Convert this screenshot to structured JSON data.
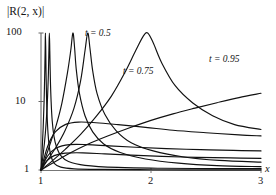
{
  "figure": {
    "ylabel": "|R(2, x)|",
    "xlabel": "x",
    "y_ticks": [
      "100",
      "10",
      "1"
    ],
    "x_ticks": [
      "1",
      "2",
      "3"
    ],
    "curve_labels": [
      "t = 0.5",
      "t = 0.75",
      "t = 0.95"
    ]
  },
  "chart_data": {
    "type": "line",
    "title": "",
    "xlabel": "x",
    "ylabel": "|R(2, x)|",
    "xlim": [
      1,
      3
    ],
    "ylim": [
      1,
      100
    ],
    "yscale": "log",
    "xscale": "linear",
    "grid": false,
    "legend": "inline-annotations",
    "xticks": [
      1,
      2,
      3
    ],
    "yticks": [
      1,
      10,
      100
    ],
    "annotations": [
      {
        "text": "t = 0.5",
        "x": 1.42,
        "y": 62
      },
      {
        "text": "t = 0.75",
        "x": 1.72,
        "y": 23
      },
      {
        "text": "t = 0.95",
        "x": 2.46,
        "y": 30
      }
    ],
    "series": [
      {
        "name": "t = 0.5 (pole a)",
        "comment": "steep vertical asymptote just right of x=1",
        "x": [
          1.0,
          1.01,
          1.02,
          1.028,
          1.034,
          1.038,
          1.04,
          1.043,
          1.046,
          1.05,
          1.056,
          1.064,
          1.075,
          1.09,
          1.12,
          1.18,
          1.3,
          1.55,
          2.0,
          2.5,
          3.0
        ],
        "y": [
          1.0,
          1.9,
          4.2,
          10.0,
          26.0,
          60.0,
          100.0,
          60.0,
          26.0,
          12.0,
          6.0,
          3.4,
          2.2,
          1.6,
          1.25,
          1.1,
          1.04,
          1.02,
          1.01,
          1.005,
          1.003
        ]
      },
      {
        "name": "t = 0.5 (pole b)",
        "comment": "second narrow spike",
        "x": [
          1.0,
          1.02,
          1.04,
          1.055,
          1.066,
          1.072,
          1.076,
          1.08,
          1.085,
          1.092,
          1.102,
          1.118,
          1.14,
          1.18,
          1.25,
          1.4,
          1.7,
          2.1,
          2.55,
          3.0
        ],
        "y": [
          1.0,
          1.7,
          3.5,
          8.0,
          22.0,
          55.0,
          100.0,
          55.0,
          22.0,
          10.0,
          5.2,
          3.1,
          2.2,
          1.62,
          1.33,
          1.17,
          1.09,
          1.06,
          1.05,
          1.05
        ]
      },
      {
        "name": "t = 0.5 (pole c)",
        "comment": "broad U-shaped spike near x=1.3",
        "x": [
          1.0,
          1.04,
          1.09,
          1.14,
          1.19,
          1.24,
          1.27,
          1.29,
          1.305,
          1.32,
          1.35,
          1.4,
          1.47,
          1.57,
          1.72,
          1.95,
          2.25,
          2.6,
          3.0
        ],
        "y": [
          1.0,
          1.5,
          2.6,
          4.6,
          9.5,
          26.0,
          55.0,
          100.0,
          62.0,
          30.0,
          13.0,
          6.2,
          3.6,
          2.4,
          1.8,
          1.45,
          1.26,
          1.16,
          1.12
        ]
      },
      {
        "name": "t = 0.5 (pole d)",
        "comment": "tall spike near x=1.42 labelled t = 0.5",
        "x": [
          1.0,
          1.06,
          1.14,
          1.22,
          1.3,
          1.36,
          1.4,
          1.425,
          1.445,
          1.47,
          1.51,
          1.58,
          1.68,
          1.82,
          2.02,
          2.3,
          2.62,
          3.0
        ],
        "y": [
          1.0,
          1.4,
          2.2,
          3.8,
          8.0,
          20.0,
          55.0,
          100.0,
          60.0,
          28.0,
          13.0,
          6.5,
          3.8,
          2.5,
          1.9,
          1.55,
          1.38,
          1.3
        ]
      },
      {
        "name": "t = 0.75",
        "comment": "wide spike peaking off the top near x=1.95, decaying to the right",
        "x": [
          1.0,
          1.1,
          1.22,
          1.36,
          1.5,
          1.64,
          1.76,
          1.86,
          1.93,
          1.97,
          2.02,
          2.1,
          2.22,
          2.38,
          2.56,
          2.76,
          3.0
        ],
        "y": [
          1.0,
          1.35,
          2.0,
          3.3,
          6.0,
          12.0,
          26.0,
          55.0,
          90.0,
          100.0,
          72.0,
          36.0,
          17.0,
          9.5,
          6.2,
          4.6,
          3.9
        ]
      },
      {
        "name": "t = 0.95",
        "comment": "monotonically increasing curve crossing t = 0.75 near x = 2.35",
        "x": [
          1.0,
          1.12,
          1.26,
          1.42,
          1.6,
          1.8,
          2.0,
          2.2,
          2.4,
          2.6,
          2.8,
          3.0
        ],
        "y": [
          1.0,
          1.3,
          1.75,
          2.35,
          3.1,
          4.1,
          5.3,
          6.6,
          8.0,
          9.6,
          11.4,
          13.2
        ]
      },
      {
        "name": "lower branch 1",
        "comment": "curve rising to ~4 then slowly decaying toward 3",
        "x": [
          1.0,
          1.06,
          1.13,
          1.22,
          1.34,
          1.5,
          1.7,
          1.95,
          2.2,
          2.5,
          2.8,
          3.0
        ],
        "y": [
          1.0,
          2.2,
          3.6,
          4.6,
          5.0,
          4.9,
          4.6,
          4.2,
          3.8,
          3.5,
          3.25,
          3.15
        ]
      },
      {
        "name": "lower branch 2",
        "comment": "flat low curve settling near 1.9",
        "x": [
          1.0,
          1.06,
          1.14,
          1.26,
          1.42,
          1.62,
          1.86,
          2.14,
          2.45,
          2.75,
          3.0
        ],
        "y": [
          1.0,
          1.6,
          2.1,
          2.35,
          2.35,
          2.25,
          2.15,
          2.05,
          1.98,
          1.93,
          1.9
        ]
      },
      {
        "name": "lower branch 3",
        "comment": "lowest nearly-flat curve settling near 1.5",
        "x": [
          1.0,
          1.05,
          1.12,
          1.22,
          1.38,
          1.58,
          1.82,
          2.1,
          2.42,
          2.72,
          3.0
        ],
        "y": [
          1.0,
          1.35,
          1.62,
          1.76,
          1.78,
          1.72,
          1.65,
          1.58,
          1.53,
          1.5,
          1.48
        ]
      }
    ]
  }
}
